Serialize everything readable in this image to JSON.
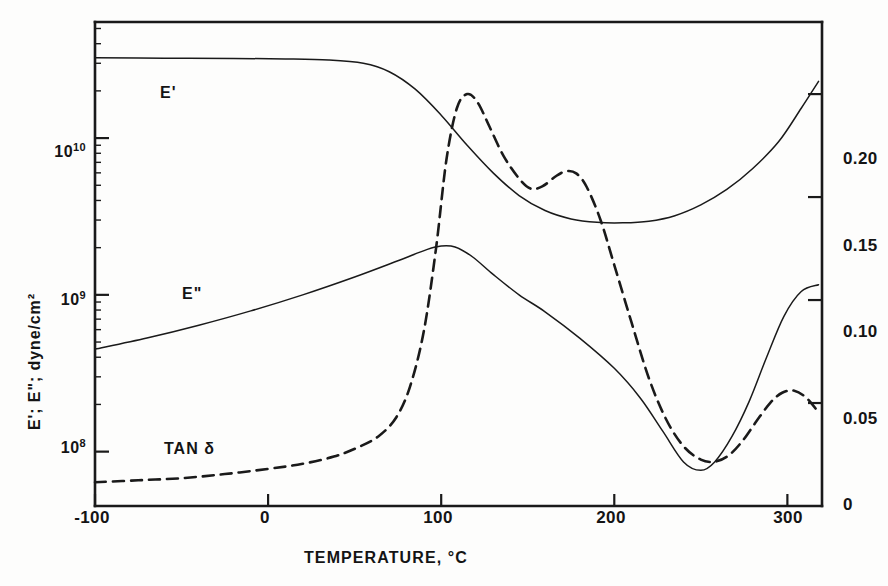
{
  "figure": {
    "background_color": "#fdfdfc",
    "ink_color": "#1a1a1a"
  },
  "chart_data": {
    "type": "line",
    "title": "",
    "xlabel": "TEMPERATURE, °C",
    "ylabel_left": "E'; E\"; dyne/cm²",
    "ylabel_right": "",
    "grid": false,
    "legend_position": "inline-annotations",
    "x": {
      "label": "TEMPERATURE, °C",
      "ticks": [
        -100,
        0,
        100,
        200,
        300
      ],
      "tick_labels": [
        "-100",
        "0",
        "100",
        "200",
        "300"
      ],
      "lim": [
        -100,
        320
      ],
      "unit": "°C"
    },
    "y_left": {
      "label": "E'; E\"; dyne/cm²",
      "scale": "log",
      "ticks": [
        100000000.0,
        1000000000.0,
        10000000000.0
      ],
      "tick_labels": [
        "10⁸",
        "10⁹",
        "10¹⁰"
      ],
      "tick_mantissa": [
        "10",
        "10",
        "10"
      ],
      "tick_exponent": [
        "8",
        "9",
        "10"
      ],
      "lim": [
        45000000.0,
        55000000000.0
      ],
      "unit": "dyne/cm²"
    },
    "y_right": {
      "label": "",
      "scale": "linear",
      "ticks": [
        0,
        0.05,
        0.1,
        0.15,
        0.2
      ],
      "tick_labels": [
        "0",
        "0.05",
        "0.10",
        "0.15",
        "0.20"
      ],
      "lim": [
        0,
        0.235
      ]
    },
    "series": [
      {
        "name": "E'",
        "label": "E'",
        "axis": "left",
        "style": "solid",
        "color": "#1a1a1a",
        "linewidth": 1.5,
        "label_position": {
          "x": -62,
          "y": 15500000000.0
        },
        "points": [
          {
            "x": -100,
            "y": 32500000000.0
          },
          {
            "x": -60,
            "y": 32300000000.0
          },
          {
            "x": -20,
            "y": 32200000000.0
          },
          {
            "x": 10,
            "y": 32000000000.0
          },
          {
            "x": 35,
            "y": 31500000000.0
          },
          {
            "x": 55,
            "y": 30000000000.0
          },
          {
            "x": 70,
            "y": 26500000000.0
          },
          {
            "x": 85,
            "y": 20500000000.0
          },
          {
            "x": 100,
            "y": 14000000000.0
          },
          {
            "x": 115,
            "y": 9000000000.0
          },
          {
            "x": 130,
            "y": 6000000000.0
          },
          {
            "x": 145,
            "y": 4300000000.0
          },
          {
            "x": 160,
            "y": 3450000000.0
          },
          {
            "x": 175,
            "y": 3050000000.0
          },
          {
            "x": 190,
            "y": 2900000000.0
          },
          {
            "x": 205,
            "y": 2880000000.0
          },
          {
            "x": 220,
            "y": 2950000000.0
          },
          {
            "x": 235,
            "y": 3200000000.0
          },
          {
            "x": 250,
            "y": 3750000000.0
          },
          {
            "x": 265,
            "y": 4700000000.0
          },
          {
            "x": 280,
            "y": 6400000000.0
          },
          {
            "x": 295,
            "y": 9500000000.0
          },
          {
            "x": 308,
            "y": 15500000000.0
          },
          {
            "x": 318,
            "y": 23000000000.0
          }
        ]
      },
      {
        "name": "E\"",
        "label": "E\"",
        "axis": "left",
        "style": "solid",
        "color": "#1a1a1a",
        "linewidth": 1.5,
        "label_position": {
          "x": -52,
          "y": 700000000.0
        },
        "points": [
          {
            "x": -100,
            "y": 450000000.0
          },
          {
            "x": -70,
            "y": 530000000.0
          },
          {
            "x": -40,
            "y": 640000000.0
          },
          {
            "x": -10,
            "y": 790000000.0
          },
          {
            "x": 20,
            "y": 1000000000.0
          },
          {
            "x": 50,
            "y": 1300000000.0
          },
          {
            "x": 75,
            "y": 1650000000.0
          },
          {
            "x": 92,
            "y": 1950000000.0
          },
          {
            "x": 100,
            "y": 2050000000.0
          },
          {
            "x": 108,
            "y": 2020000000.0
          },
          {
            "x": 118,
            "y": 1750000000.0
          },
          {
            "x": 130,
            "y": 1350000000.0
          },
          {
            "x": 145,
            "y": 1000000000.0
          },
          {
            "x": 160,
            "y": 780000000.0
          },
          {
            "x": 180,
            "y": 530000000.0
          },
          {
            "x": 200,
            "y": 340000000.0
          },
          {
            "x": 215,
            "y": 220000000.0
          },
          {
            "x": 228,
            "y": 135000000.0
          },
          {
            "x": 240,
            "y": 86000000.0
          },
          {
            "x": 250,
            "y": 76000000.0
          },
          {
            "x": 258,
            "y": 86000000.0
          },
          {
            "x": 268,
            "y": 125000000.0
          },
          {
            "x": 278,
            "y": 210000000.0
          },
          {
            "x": 288,
            "y": 400000000.0
          },
          {
            "x": 298,
            "y": 730000000.0
          },
          {
            "x": 308,
            "y": 1050000000.0
          },
          {
            "x": 318,
            "y": 1160000000.0
          }
        ]
      },
      {
        "name": "TAN δ",
        "label": "TAN δ",
        "axis": "right",
        "style": "dashed",
        "color": "#1a1a1a",
        "linewidth": 2.6,
        "dash_pattern": "11 7",
        "label_position": {
          "x": -48,
          "y": 0.034
        },
        "points": [
          {
            "x": -100,
            "y": 0.0115
          },
          {
            "x": -75,
            "y": 0.0125
          },
          {
            "x": -50,
            "y": 0.0135
          },
          {
            "x": -25,
            "y": 0.0155
          },
          {
            "x": 0,
            "y": 0.018
          },
          {
            "x": 20,
            "y": 0.0205
          },
          {
            "x": 38,
            "y": 0.024
          },
          {
            "x": 52,
            "y": 0.0285
          },
          {
            "x": 64,
            "y": 0.034
          },
          {
            "x": 74,
            "y": 0.043
          },
          {
            "x": 82,
            "y": 0.058
          },
          {
            "x": 90,
            "y": 0.085
          },
          {
            "x": 97,
            "y": 0.125
          },
          {
            "x": 103,
            "y": 0.168
          },
          {
            "x": 109,
            "y": 0.193
          },
          {
            "x": 115,
            "y": 0.2
          },
          {
            "x": 121,
            "y": 0.196
          },
          {
            "x": 128,
            "y": 0.184
          },
          {
            "x": 136,
            "y": 0.17
          },
          {
            "x": 145,
            "y": 0.159
          },
          {
            "x": 152,
            "y": 0.154
          },
          {
            "x": 159,
            "y": 0.1555
          },
          {
            "x": 166,
            "y": 0.16
          },
          {
            "x": 172,
            "y": 0.1625
          },
          {
            "x": 178,
            "y": 0.1615
          },
          {
            "x": 184,
            "y": 0.155
          },
          {
            "x": 192,
            "y": 0.139
          },
          {
            "x": 200,
            "y": 0.117
          },
          {
            "x": 210,
            "y": 0.089
          },
          {
            "x": 220,
            "y": 0.062
          },
          {
            "x": 230,
            "y": 0.042
          },
          {
            "x": 240,
            "y": 0.029
          },
          {
            "x": 250,
            "y": 0.0225
          },
          {
            "x": 258,
            "y": 0.0215
          },
          {
            "x": 266,
            "y": 0.0245
          },
          {
            "x": 274,
            "y": 0.0315
          },
          {
            "x": 282,
            "y": 0.041
          },
          {
            "x": 290,
            "y": 0.05
          },
          {
            "x": 297,
            "y": 0.055
          },
          {
            "x": 304,
            "y": 0.056
          },
          {
            "x": 311,
            "y": 0.0525
          },
          {
            "x": 318,
            "y": 0.0455
          }
        ]
      }
    ],
    "annotations": [
      {
        "text": "E'",
        "name": "e-prime-label"
      },
      {
        "text": "E\"",
        "name": "e-double-prime-label"
      },
      {
        "text": "TAN δ",
        "name": "tan-delta-label"
      }
    ]
  }
}
